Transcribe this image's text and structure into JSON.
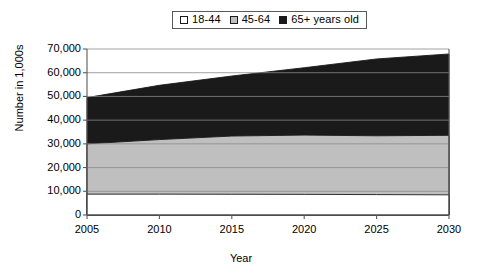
{
  "chart_data": {
    "type": "area",
    "title": "",
    "subtitle": "",
    "xlabel": "Year",
    "ylabel": "Number in 1,000s",
    "x": [
      2005,
      2010,
      2015,
      2020,
      2025,
      2030
    ],
    "xlim": [
      2005,
      2030
    ],
    "ylim": [
      0,
      70000
    ],
    "xticks": [
      "2005",
      "2010",
      "2015",
      "2020",
      "2025",
      "2030"
    ],
    "yticks": [
      "0",
      "10,000",
      "20,000",
      "30,000",
      "40,000",
      "50,000",
      "60,000",
      "70,000"
    ],
    "ytick_values": [
      0,
      10000,
      20000,
      30000,
      40000,
      50000,
      60000,
      70000
    ],
    "stacked": true,
    "grid": "horizontal",
    "legend_position": "top-center",
    "series": [
      {
        "name": "18-44",
        "color": "#ffffff",
        "values": [
          8800,
          8800,
          8750,
          8700,
          8600,
          8500
        ]
      },
      {
        "name": "45-64",
        "color": "#bfbfbf",
        "values": [
          21200,
          23000,
          24550,
          25000,
          24800,
          25100
        ]
      },
      {
        "name": "65+ years old",
        "color": "#1a1a1a",
        "values": [
          19500,
          22900,
          25300,
          28400,
          32400,
          34300
        ]
      }
    ],
    "cumulative_tops": {
      "18-44": [
        8800,
        8800,
        8750,
        8700,
        8600,
        8500
      ],
      "45-64": [
        30000,
        31800,
        33300,
        33700,
        33400,
        33600
      ],
      "65+ years old": [
        49500,
        54700,
        58600,
        62100,
        65800,
        67900
      ]
    },
    "annotations": []
  },
  "legend": {
    "entries": [
      {
        "label": "18-44",
        "icon": "legend-swatch-white"
      },
      {
        "label": "45-64",
        "icon": "legend-swatch-gray"
      },
      {
        "label": "65+ years old",
        "icon": "legend-swatch-black"
      }
    ]
  },
  "colors": {
    "age_18_44": "#ffffff",
    "age_45_64": "#bfbfbf",
    "age_65_plus": "#1a1a1a",
    "axis": "#5a5a5a",
    "gridline": "#8a8a8a",
    "text": "#000000",
    "background": "#ffffff"
  }
}
